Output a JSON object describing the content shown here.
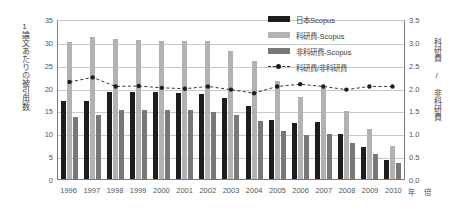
{
  "chart_data": {
    "type": "bar",
    "title": "",
    "xlabel": "年",
    "ylabel": "1論文あたりの被引用数",
    "y2label": "科研費 / 非科研費",
    "y2unit": "倍",
    "ylim": [
      0,
      35
    ],
    "y2lim": [
      0.0,
      3.5
    ],
    "yticks": [
      "35",
      "30",
      "25",
      "20",
      "15",
      "10",
      "5",
      "0"
    ],
    "y2ticks": [
      "3.5",
      "3.0",
      "2.5",
      "2.0",
      "1.5",
      "1.0",
      "0.5",
      "0.0"
    ],
    "grid": true,
    "legend_position": "top-right",
    "categories": [
      "1996",
      "1997",
      "1998",
      "1999",
      "2000",
      "2001",
      "2002",
      "2003",
      "2004",
      "2005",
      "2006",
      "2007",
      "2008",
      "2009",
      "2010"
    ],
    "series": [
      {
        "name": "日本Scopus",
        "type": "bar",
        "color": "#1d1d1d",
        "axis": "left",
        "values": [
          17.0,
          17.1,
          19.0,
          19.0,
          19.1,
          18.9,
          18.6,
          17.8,
          16.0,
          13.0,
          12.3,
          12.5,
          9.8,
          7.0,
          4.2
        ]
      },
      {
        "name": "科研費-Scopus",
        "type": "bar",
        "color": "#b2b2b2",
        "axis": "left",
        "values": [
          30.0,
          31.0,
          30.7,
          30.4,
          30.3,
          30.2,
          30.2,
          28.0,
          25.8,
          21.5,
          18.0,
          20.0,
          14.8,
          11.0,
          7.3
        ]
      },
      {
        "name": "非科研費-Scopus",
        "type": "bar",
        "color": "#787878",
        "axis": "left",
        "values": [
          13.5,
          14.0,
          15.0,
          15.0,
          15.1,
          15.0,
          14.7,
          14.0,
          12.8,
          10.5,
          9.7,
          9.8,
          7.8,
          5.5,
          3.5
        ]
      },
      {
        "name": "科研費/非科研費",
        "type": "line",
        "color": "#1d1d1d",
        "axis": "right",
        "style": "dashed-marker",
        "values": [
          2.15,
          2.25,
          2.05,
          2.06,
          2.02,
          2.0,
          2.05,
          1.98,
          1.9,
          2.05,
          2.1,
          2.05,
          1.98,
          2.05,
          2.05
        ]
      }
    ]
  },
  "legend": {
    "items": [
      {
        "label": "日本Scopus"
      },
      {
        "label": "科研費-Scopus"
      },
      {
        "label": "非科研費-Scopus"
      },
      {
        "label": "科研費/非科研費"
      }
    ]
  }
}
